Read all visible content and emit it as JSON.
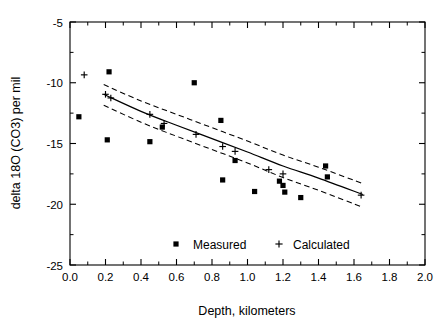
{
  "chart_data": {
    "type": "scatter",
    "title": "",
    "xlabel": "Depth,  kilometers",
    "ylabel": "delta 18O (CO3) per mil",
    "xlim": [
      0.0,
      2.0
    ],
    "ylim": [
      -25,
      -5
    ],
    "xticks": [
      "0.0",
      "0.2",
      "0.4",
      "0.6",
      "0.8",
      "1.0",
      "1.2",
      "1.4",
      "1.6",
      "1.8",
      "2.0"
    ],
    "xtick_values": [
      0.0,
      0.2,
      0.4,
      0.6,
      0.8,
      1.0,
      1.2,
      1.4,
      1.6,
      1.8,
      2.0
    ],
    "yticks": [
      "-5",
      "-10",
      "-15",
      "-20",
      "-25"
    ],
    "ytick_values": [
      -5,
      -10,
      -15,
      -20,
      -25
    ],
    "grid": false,
    "legend_position": "inside-bottom-center",
    "series": [
      {
        "name": "Measured",
        "marker": "square",
        "points": [
          {
            "x": 0.05,
            "y": -12.8
          },
          {
            "x": 0.22,
            "y": -9.1
          },
          {
            "x": 0.21,
            "y": -14.7
          },
          {
            "x": 0.45,
            "y": -14.85
          },
          {
            "x": 0.52,
            "y": -13.65
          },
          {
            "x": 0.7,
            "y": -10.0
          },
          {
            "x": 0.85,
            "y": -13.1
          },
          {
            "x": 0.86,
            "y": -18.0
          },
          {
            "x": 0.93,
            "y": -16.4
          },
          {
            "x": 1.04,
            "y": -18.95
          },
          {
            "x": 1.18,
            "y": -18.1
          },
          {
            "x": 1.2,
            "y": -18.45
          },
          {
            "x": 1.21,
            "y": -19.0
          },
          {
            "x": 1.3,
            "y": -19.45
          },
          {
            "x": 1.44,
            "y": -16.85
          },
          {
            "x": 1.45,
            "y": -17.75
          }
        ]
      },
      {
        "name": "Calculated",
        "marker": "plus",
        "points": [
          {
            "x": 0.08,
            "y": -9.35
          },
          {
            "x": 0.2,
            "y": -10.95
          },
          {
            "x": 0.23,
            "y": -11.25
          },
          {
            "x": 0.45,
            "y": -12.6
          },
          {
            "x": 0.53,
            "y": -13.35
          },
          {
            "x": 0.71,
            "y": -14.25
          },
          {
            "x": 0.86,
            "y": -15.25
          },
          {
            "x": 0.93,
            "y": -15.65
          },
          {
            "x": 1.12,
            "y": -17.15
          },
          {
            "x": 1.2,
            "y": -17.5
          },
          {
            "x": 1.64,
            "y": -19.25
          }
        ]
      }
    ],
    "fit_curve": {
      "name": "regression-fit",
      "style": "solid",
      "points": [
        {
          "x": 0.19,
          "y": -10.95
        },
        {
          "x": 0.4,
          "y": -12.35
        },
        {
          "x": 0.6,
          "y": -13.5
        },
        {
          "x": 0.8,
          "y": -14.6
        },
        {
          "x": 1.0,
          "y": -15.7
        },
        {
          "x": 1.2,
          "y": -16.85
        },
        {
          "x": 1.4,
          "y": -17.85
        },
        {
          "x": 1.65,
          "y": -19.2
        }
      ]
    },
    "confidence_bands": [
      {
        "name": "upper-confidence-band",
        "style": "dashed",
        "points": [
          {
            "x": 0.19,
            "y": -10.15
          },
          {
            "x": 0.4,
            "y": -11.5
          },
          {
            "x": 0.6,
            "y": -12.6
          },
          {
            "x": 0.8,
            "y": -13.7
          },
          {
            "x": 1.0,
            "y": -14.8
          },
          {
            "x": 1.2,
            "y": -15.95
          },
          {
            "x": 1.4,
            "y": -16.95
          },
          {
            "x": 1.65,
            "y": -18.3
          }
        ]
      },
      {
        "name": "lower-confidence-band",
        "style": "dashed",
        "points": [
          {
            "x": 0.19,
            "y": -11.85
          },
          {
            "x": 0.4,
            "y": -13.25
          },
          {
            "x": 0.6,
            "y": -14.4
          },
          {
            "x": 0.8,
            "y": -15.5
          },
          {
            "x": 1.0,
            "y": -16.6
          },
          {
            "x": 1.2,
            "y": -17.8
          },
          {
            "x": 1.4,
            "y": -18.85
          },
          {
            "x": 1.65,
            "y": -20.25
          }
        ]
      }
    ],
    "legend": [
      {
        "label": "Measured",
        "marker": "square"
      },
      {
        "label": "Calculated",
        "marker": "plus"
      }
    ]
  }
}
